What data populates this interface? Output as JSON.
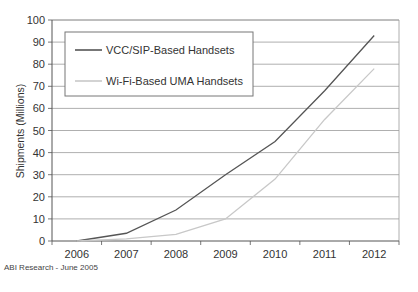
{
  "chart_data": {
    "type": "line",
    "title": "",
    "xlabel": "",
    "ylabel": "Shipments (Millions)",
    "categories": [
      "2006",
      "2007",
      "2008",
      "2009",
      "2010",
      "2011",
      "2012"
    ],
    "ylim": [
      0,
      100
    ],
    "yticks": [
      0,
      10,
      20,
      30,
      40,
      50,
      60,
      70,
      80,
      90,
      100
    ],
    "grid": true,
    "legend_position": "top-left",
    "series": [
      {
        "name": "VCC/SIP-Based Handsets",
        "color": "#555555",
        "values": [
          0,
          3.5,
          14,
          30,
          45,
          68,
          93
        ]
      },
      {
        "name": "Wi-Fi-Based UMA Handsets",
        "color": "#c8c8c8",
        "values": [
          0,
          1,
          3,
          10,
          28,
          55,
          78
        ]
      }
    ],
    "source": "ABI Research - June 2005"
  }
}
